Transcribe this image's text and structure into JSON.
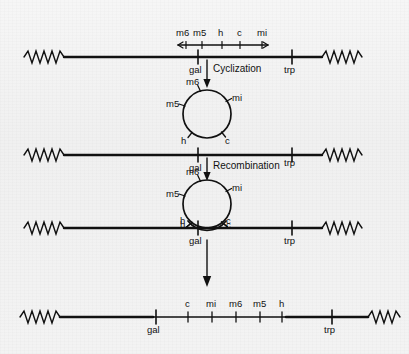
{
  "figure": {
    "type": "genetics-recombination-diagram",
    "background_color": "#f2f2f2",
    "stroke_color": "#111111",
    "markers": [
      "m6",
      "m5",
      "h",
      "c",
      "mi"
    ],
    "bacterial_loci": [
      "gal",
      "trp"
    ],
    "processes": [
      "Cyclization",
      "Recombination"
    ]
  },
  "scale_bar": {
    "label_m6": "m6",
    "label_m5": "m5",
    "label_h": "h",
    "label_c": "c",
    "label_mi": "mi"
  },
  "row1": {
    "name": "linear-phage-map",
    "gal": "gal",
    "trp": "trp"
  },
  "step1": {
    "label": "Cyclization"
  },
  "circle1": {
    "name": "free-circular-phage",
    "m6": "m6",
    "m5": "m5",
    "mi": "mi",
    "h": "h",
    "c": "c"
  },
  "row2": {
    "name": "bacterial-chromosome",
    "gal": "gal",
    "trp": "trp"
  },
  "step2": {
    "label": "Recombination"
  },
  "circle2": {
    "name": "paired-circle-on-chromosome",
    "m6": "m6",
    "m5": "m5",
    "mi": "mi",
    "h": "h",
    "c": "c"
  },
  "row3": {
    "name": "crossover-intermediate",
    "gal": "gal",
    "trp": "trp",
    "h": "h",
    "c": "c"
  },
  "row4": {
    "name": "integrated-prophage-map",
    "gal": "gal",
    "trp": "trp",
    "order": [
      "c",
      "mi",
      "m6",
      "m5",
      "h"
    ],
    "m_c": "c",
    "m_mi": "mi",
    "m_m6": "m6",
    "m_m5": "m5",
    "m_h": "h"
  }
}
